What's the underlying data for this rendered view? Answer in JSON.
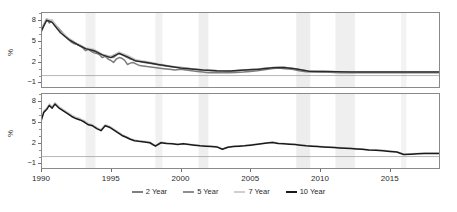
{
  "chart_data": {
    "type": "line",
    "title": "",
    "xlabel": "",
    "ylabel": "%",
    "xlim": [
      1990,
      2018.6
    ],
    "ylim": [
      -1.8,
      9.2
    ],
    "yticks": [
      -1,
      2,
      5,
      8
    ],
    "ytick_labels": [
      "-1",
      "2",
      "5",
      "8"
    ],
    "xticks": [
      1990,
      1995,
      2000,
      2005,
      2010,
      2015
    ],
    "xtick_labels": [
      "1990",
      "1995",
      "2000",
      "2005",
      "2010",
      "2015"
    ],
    "grid": false,
    "zero_line": 0,
    "legend_position": "bottom",
    "legend": [
      {
        "name": "2 Year",
        "color": "#808080"
      },
      {
        "name": "5 Year",
        "color": "#8f8f8f"
      },
      {
        "name": "7 Year",
        "color": "#cfcfcf"
      },
      {
        "name": "10 Year",
        "color": "#1a1a1a"
      }
    ],
    "shaded_bands": [
      {
        "x0": 1993.2,
        "x1": 1993.9,
        "color": "#f1f1f1"
      },
      {
        "x0": 1998.2,
        "x1": 1998.7,
        "color": "#f1f1f1"
      },
      {
        "x0": 2001.3,
        "x1": 2002.0,
        "color": "#eeeeee"
      },
      {
        "x0": 2008.3,
        "x1": 2009.3,
        "color": "#ededed"
      },
      {
        "x0": 2011.1,
        "x1": 2012.5,
        "color": "#efefef"
      },
      {
        "x0": 2015.8,
        "x1": 2016.2,
        "color": "#f3f3f3"
      }
    ],
    "panels": [
      {
        "panel": "top",
        "ylabel": "%",
        "series": [
          {
            "name": "2 Year",
            "color": "#7d7d7d",
            "x": [
              1990.0,
              1990.2,
              1990.4,
              1990.6,
              1990.8,
              1991.0,
              1991.2,
              1991.4,
              1991.6,
              1991.8,
              1992.0,
              1992.2,
              1992.4,
              1992.6,
              1992.8,
              1993.0,
              1993.2,
              1993.4,
              1993.6,
              1993.8,
              1994.0,
              1994.2,
              1994.4,
              1994.6,
              1994.8,
              1995.0,
              1995.2,
              1995.4,
              1995.6,
              1995.8,
              1996.0,
              1996.2,
              1996.4,
              1996.6,
              1996.8,
              1997.0,
              1997.3,
              1997.6,
              1998.0,
              1998.4,
              1998.8,
              1999.2,
              1999.6,
              2000.0,
              2000.4,
              2000.8,
              2001.2,
              2001.6,
              2002.0,
              2002.5,
              2003.0,
              2003.5,
              2004.0,
              2004.5,
              2005.0,
              2005.5,
              2006.0,
              2006.5,
              2007.0,
              2007.5,
              2008.0,
              2008.5,
              2009.0,
              2009.5,
              2010.0,
              2010.5,
              2011.0,
              2011.5,
              2012.0,
              2012.5,
              2013.0,
              2013.5,
              2014.0,
              2014.5,
              2015.0,
              2015.5,
              2016.0,
              2016.5,
              2017.0,
              2017.5,
              2018.0,
              2018.5
            ],
            "y": [
              6.2,
              7.3,
              8.2,
              7.6,
              8.0,
              7.2,
              6.8,
              6.5,
              5.9,
              5.6,
              5.2,
              4.8,
              4.6,
              4.5,
              4.3,
              4.0,
              3.6,
              3.8,
              3.5,
              3.3,
              3.2,
              3.0,
              2.6,
              2.8,
              2.4,
              2.2,
              1.9,
              2.4,
              2.6,
              2.5,
              2.2,
              1.6,
              1.8,
              1.9,
              1.7,
              1.5,
              1.4,
              1.3,
              1.2,
              1.1,
              1.0,
              0.9,
              0.8,
              0.9,
              0.8,
              0.7,
              0.6,
              0.5,
              0.4,
              0.4,
              0.4,
              0.4,
              0.45,
              0.5,
              0.6,
              0.7,
              0.85,
              1.0,
              1.1,
              1.0,
              0.9,
              0.7,
              0.55,
              0.5,
              0.5,
              0.5,
              0.45,
              0.4,
              0.4,
              0.4,
              0.4,
              0.4,
              0.4,
              0.4,
              0.4,
              0.4,
              0.4,
              0.4,
              0.4,
              0.4,
              0.4,
              0.4
            ]
          },
          {
            "name": "5 Year",
            "color": "#909090",
            "x": [
              1990.0,
              1990.4,
              1990.8,
              1991.2,
              1991.6,
              1992.0,
              1992.4,
              1992.8,
              1993.2,
              1993.6,
              1994.0,
              1994.4,
              1994.8,
              1995.2,
              1995.6,
              1996.0,
              1996.4,
              1996.8,
              1997.4,
              1998.0,
              1998.6,
              1999.2,
              1999.8,
              2000.4,
              2001.0,
              2001.6,
              2002.2,
              2003.0,
              2003.8,
              2004.6,
              2005.4,
              2006.2,
              2007.0,
              2007.6,
              2008.2,
              2009.0,
              2009.8,
              2010.6,
              2011.4,
              2012.2,
              2013.0,
              2014.0,
              2015.0,
              2016.0,
              2017.0,
              2018.0,
              2018.5
            ],
            "y": [
              6.6,
              8.1,
              7.9,
              7.0,
              6.1,
              5.3,
              4.8,
              4.4,
              3.9,
              3.7,
              3.4,
              3.0,
              2.7,
              2.6,
              3.3,
              2.8,
              2.4,
              2.2,
              1.9,
              1.7,
              1.5,
              1.3,
              1.2,
              1.1,
              0.9,
              0.8,
              0.7,
              0.6,
              0.65,
              0.8,
              0.9,
              1.1,
              1.2,
              1.15,
              1.0,
              0.7,
              0.6,
              0.6,
              0.55,
              0.5,
              0.5,
              0.5,
              0.5,
              0.5,
              0.5,
              0.5,
              0.5
            ]
          },
          {
            "name": "7 Year",
            "color": "#c9c9c9",
            "x": [
              1990.0,
              1990.4,
              1990.8,
              1991.4,
              1992.0,
              1992.6,
              1993.2,
              1993.8,
              1994.4,
              1995.0,
              1995.6,
              1996.2,
              1996.8,
              1997.6,
              1998.4,
              1999.2,
              2000.0,
              2000.8,
              2001.6,
              2002.6,
              2003.6,
              2004.6,
              2005.6,
              2006.6,
              2007.4,
              2008.2,
              2009.2,
              2010.2,
              2011.2,
              2012.2,
              2013.4,
              2014.6,
              2015.8,
              2017.0,
              2018.5
            ],
            "y": [
              6.8,
              8.2,
              8.0,
              6.3,
              5.4,
              4.6,
              4.0,
              3.8,
              3.1,
              2.8,
              3.4,
              2.9,
              2.3,
              2.0,
              1.7,
              1.4,
              1.2,
              1.0,
              0.85,
              0.72,
              0.68,
              0.85,
              0.95,
              1.15,
              1.2,
              1.0,
              0.65,
              0.62,
              0.55,
              0.52,
              0.5,
              0.5,
              0.5,
              0.5,
              0.5
            ]
          },
          {
            "name": "10 Year",
            "color": "#2b2b2b",
            "x": [
              1990.0,
              1990.4,
              1990.8,
              1991.4,
              1992.0,
              1992.6,
              1993.2,
              1993.8,
              1994.4,
              1995.0,
              1995.6,
              1996.2,
              1996.8,
              1997.6,
              1998.4,
              1999.2,
              2000.0,
              2000.8,
              2001.6,
              2002.6,
              2003.6,
              2004.6,
              2005.6,
              2006.6,
              2007.4,
              2008.2,
              2009.2,
              2010.2,
              2011.2,
              2012.2,
              2013.4,
              2014.6,
              2015.8,
              2017.0,
              2018.5
            ],
            "y": [
              6.4,
              8.0,
              7.7,
              6.2,
              5.2,
              4.5,
              3.9,
              3.6,
              3.0,
              2.6,
              3.2,
              2.7,
              2.1,
              1.9,
              1.6,
              1.35,
              1.1,
              0.95,
              0.8,
              0.7,
              0.66,
              0.82,
              0.92,
              1.12,
              1.18,
              0.98,
              0.63,
              0.6,
              0.54,
              0.5,
              0.5,
              0.5,
              0.5,
              0.5,
              0.5
            ]
          }
        ]
      },
      {
        "panel": "bottom",
        "ylabel": "%",
        "series": [
          {
            "name": "7 Year",
            "color": "#c9c9c9",
            "x": [
              1990.0,
              1990.2,
              1990.4,
              1990.6,
              1990.8,
              1991.0,
              1991.3,
              1991.6,
              1991.9,
              1992.2,
              1992.5,
              1992.8,
              1993.1,
              1993.4,
              1993.7,
              1994.0,
              1994.3,
              1994.6,
              1994.9,
              1995.2,
              1995.5,
              1995.8,
              1996.1,
              1996.4,
              1996.7,
              1997.0,
              1997.4,
              1997.8,
              1998.2,
              1998.6,
              1999.0,
              1999.4,
              1999.8,
              2000.2,
              2000.6,
              2001.0,
              2001.4,
              2001.8,
              2002.2,
              2002.6,
              2003.0,
              2003.4,
              2003.8,
              2004.2,
              2004.6,
              2005.0,
              2005.4,
              2005.8,
              2006.2,
              2006.6,
              2007.0,
              2007.4,
              2007.8,
              2008.2,
              2008.6,
              2009.0,
              2009.4,
              2009.8,
              2010.2,
              2010.6,
              2011.0,
              2011.4,
              2011.8,
              2012.2,
              2012.6,
              2013.0,
              2013.5,
              2014.0,
              2014.5,
              2015.0,
              2015.5,
              2016.0,
              2016.5,
              2017.0,
              2017.5,
              2018.0,
              2018.5
            ],
            "y": [
              5.3,
              6.6,
              7.0,
              7.6,
              7.2,
              7.8,
              7.2,
              6.8,
              6.4,
              6.0,
              5.7,
              5.5,
              5.2,
              4.8,
              4.6,
              4.2,
              3.9,
              4.6,
              4.4,
              4.0,
              3.6,
              3.2,
              2.9,
              2.6,
              2.4,
              2.3,
              2.2,
              2.1,
              1.6,
              2.1,
              2.0,
              1.9,
              1.8,
              1.9,
              1.8,
              1.7,
              1.6,
              1.55,
              1.5,
              1.45,
              1.1,
              1.4,
              1.5,
              1.55,
              1.6,
              1.7,
              1.8,
              1.9,
              2.0,
              2.1,
              1.95,
              1.9,
              1.85,
              1.8,
              1.7,
              1.6,
              1.55,
              1.5,
              1.45,
              1.4,
              1.35,
              1.3,
              1.25,
              1.2,
              1.15,
              1.1,
              1.0,
              0.95,
              0.9,
              0.8,
              0.7,
              0.35,
              0.4,
              0.45,
              0.5,
              0.5,
              0.5
            ]
          },
          {
            "name": "10 Year",
            "color": "#1a1a1a",
            "x": [
              1990.0,
              1990.2,
              1990.4,
              1990.6,
              1990.8,
              1991.0,
              1991.3,
              1991.6,
              1991.9,
              1992.2,
              1992.5,
              1992.8,
              1993.1,
              1993.4,
              1993.7,
              1994.0,
              1994.3,
              1994.6,
              1994.9,
              1995.2,
              1995.5,
              1995.8,
              1996.1,
              1996.4,
              1996.7,
              1997.0,
              1997.4,
              1997.8,
              1998.2,
              1998.6,
              1999.0,
              1999.4,
              1999.8,
              2000.2,
              2000.6,
              2001.0,
              2001.4,
              2001.8,
              2002.2,
              2002.6,
              2003.0,
              2003.4,
              2003.8,
              2004.2,
              2004.6,
              2005.0,
              2005.4,
              2005.8,
              2006.2,
              2006.6,
              2007.0,
              2007.4,
              2007.8,
              2008.2,
              2008.6,
              2009.0,
              2009.4,
              2009.8,
              2010.2,
              2010.6,
              2011.0,
              2011.4,
              2011.8,
              2012.2,
              2012.6,
              2013.0,
              2013.5,
              2014.0,
              2014.5,
              2015.0,
              2015.5,
              2016.0,
              2016.5,
              2017.0,
              2017.5,
              2018.0,
              2018.5
            ],
            "y": [
              5.1,
              6.4,
              6.8,
              7.4,
              7.0,
              7.6,
              7.0,
              6.6,
              6.2,
              5.8,
              5.5,
              5.3,
              5.0,
              4.6,
              4.45,
              4.05,
              3.75,
              4.45,
              4.25,
              3.85,
              3.45,
              3.05,
              2.8,
              2.5,
              2.3,
              2.2,
              2.1,
              2.0,
              1.5,
              2.0,
              1.9,
              1.85,
              1.75,
              1.85,
              1.75,
              1.65,
              1.55,
              1.5,
              1.45,
              1.4,
              1.05,
              1.35,
              1.45,
              1.5,
              1.55,
              1.65,
              1.75,
              1.85,
              1.95,
              2.05,
              1.9,
              1.85,
              1.8,
              1.75,
              1.65,
              1.55,
              1.5,
              1.45,
              1.4,
              1.35,
              1.3,
              1.25,
              1.2,
              1.15,
              1.1,
              1.05,
              0.95,
              0.9,
              0.85,
              0.75,
              0.65,
              0.3,
              0.35,
              0.4,
              0.45,
              0.45,
              0.45
            ]
          }
        ]
      }
    ]
  }
}
